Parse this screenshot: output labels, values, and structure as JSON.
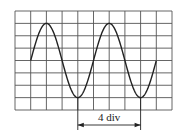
{
  "diagram": {
    "type": "oscilloscope-trace",
    "grid": {
      "columns": 10,
      "rows": 8
    },
    "waveform": {
      "shape": "sine",
      "period_div": 4,
      "amplitude_div": 3,
      "start_div": 1,
      "end_div": 9,
      "start_phase": "zero-crossing-rising"
    },
    "measurement": {
      "label": "4 div",
      "from_div": 4,
      "to_div": 8
    }
  }
}
